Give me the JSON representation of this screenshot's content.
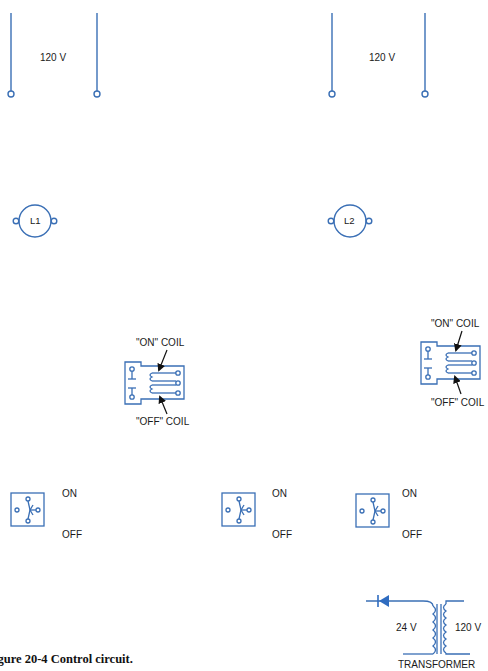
{
  "figure": {
    "caption": "igure 20-4  Control circuit.",
    "colors": {
      "wire": "#3a6fb5",
      "text": "#1a1a1a",
      "arrow": "#111111",
      "diode": "#2f6cc0"
    }
  },
  "sources": [
    {
      "id": "source-left",
      "label": "120 V"
    },
    {
      "id": "source-right",
      "label": "120 V"
    }
  ],
  "loads": [
    {
      "id": "lamp-1",
      "label": "L1"
    },
    {
      "id": "lamp-2",
      "label": "L2"
    }
  ],
  "relays": [
    {
      "id": "relay-left",
      "on_coil_label": "\"ON\" COIL",
      "off_coil_label": "\"OFF\" COIL"
    },
    {
      "id": "relay-right",
      "on_coil_label": "\"ON\" COIL",
      "off_coil_label": "\"OFF\" COIL"
    }
  ],
  "switches": [
    {
      "id": "switch-1",
      "on_label": "ON",
      "off_label": "OFF"
    },
    {
      "id": "switch-2",
      "on_label": "ON",
      "off_label": "OFF"
    },
    {
      "id": "switch-3",
      "on_label": "ON",
      "off_label": "OFF"
    }
  ],
  "transformer": {
    "primary_label": "24 V",
    "secondary_label": "120 V",
    "name_label": "TRANSFORMER"
  }
}
